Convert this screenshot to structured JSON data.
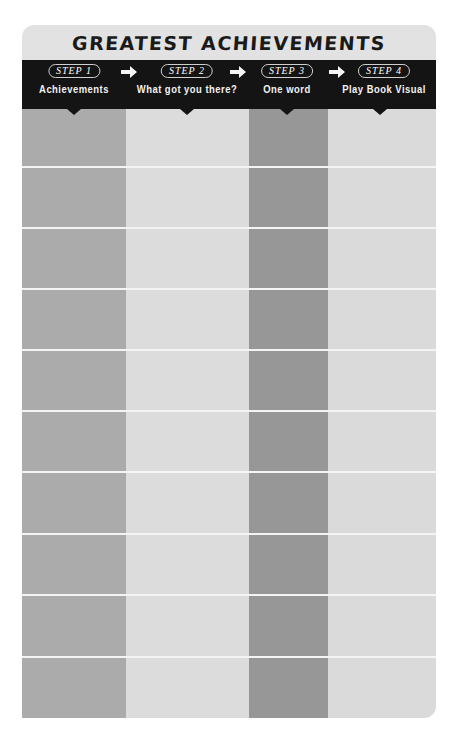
{
  "worksheet": {
    "title": "GREATEST ACHIEVEMENTS",
    "steps": [
      {
        "badge": "STEP 1",
        "label": "Achievements"
      },
      {
        "badge": "STEP 2",
        "label": "What got you there?"
      },
      {
        "badge": "STEP 3",
        "label": "One word"
      },
      {
        "badge": "STEP 4",
        "label": "Play Book Visual"
      }
    ],
    "arrow_icon": "right-arrow-icon",
    "row_count": 10,
    "colors": {
      "header_band": "#141414",
      "card_bg": "#e2e2e2",
      "col1": "#ababab",
      "col2": "#dcdcdc",
      "col3": "#979797",
      "col4": "#dadada",
      "row_line": "#f4f4f4"
    }
  }
}
